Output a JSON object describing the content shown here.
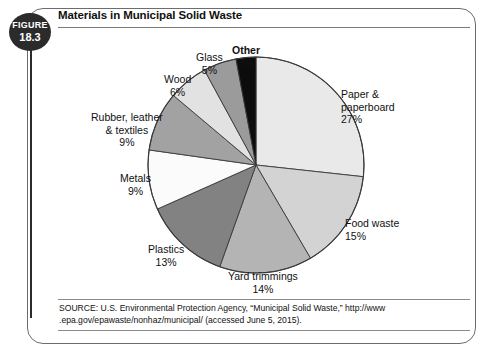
{
  "figure": {
    "badge_word": "FIGURE",
    "badge_number": "18.3"
  },
  "title": "Materials in Municipal Solid Waste",
  "source": {
    "line1": "SOURCE: U.S. Environmental Protection Agency, “Municipal Solid Waste,” http://www",
    "line2": ".epa.gov/epawaste/nonhaz/municipal/ (accessed June 5, 2015)."
  },
  "labels": {
    "paper": {
      "name": "Paper &",
      "name2": "paperboard",
      "pct": "27%"
    },
    "food": {
      "name": "Food waste",
      "pct": "15%"
    },
    "yard": {
      "name": "Yard trimmings",
      "pct": "14%"
    },
    "plastics": {
      "name": "Plastics",
      "pct": "13%"
    },
    "metals": {
      "name": "Metals",
      "pct": "9%"
    },
    "rubber": {
      "name": "Rubber, leather",
      "name2": "& textiles",
      "pct": "9%"
    },
    "wood": {
      "name": "Wood",
      "pct": "6%"
    },
    "glass": {
      "name": "Glass",
      "pct": "5%"
    },
    "other": {
      "name": "Other",
      "pct": "3%"
    }
  },
  "chart_data": {
    "type": "pie",
    "title": "Materials in Municipal Solid Waste",
    "unit": "percent of total municipal solid waste",
    "start_angle_deg": 0,
    "direction": "clockwise",
    "stroke": "#3a3a3a",
    "categories": [
      "Paper & paperboard",
      "Food waste",
      "Yard trimmings",
      "Plastics",
      "Metals",
      "Rubber, leather & textiles",
      "Wood",
      "Glass",
      "Other"
    ],
    "values": [
      27,
      15,
      14,
      13,
      9,
      9,
      6,
      5,
      3
    ],
    "colors": [
      "#e9e9e9",
      "#d3d3d3",
      "#b4b4b4",
      "#828282",
      "#fbfbfb",
      "#a2a2a2",
      "#e2e2e2",
      "#9b9b9b",
      "#0c0c0c"
    ],
    "legend": "none (direct labels with leader placement)",
    "grid": false
  }
}
